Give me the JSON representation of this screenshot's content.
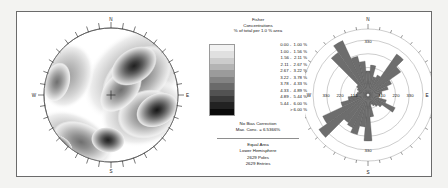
{
  "chart_data": [
    {
      "type": "heatmap",
      "subtype": "stereonet-contour",
      "title": "Fisher Concentrations equal-area lower-hemisphere pole density stereonet",
      "projection": "Equal Area",
      "hemisphere": "Lower Hemisphere",
      "poles": 2629,
      "entries": 2629,
      "max_concentration": 6.5366,
      "bias_correction": "No Bias Correction",
      "cardinal_labels": [
        "N",
        "E",
        "S",
        "W"
      ],
      "perimeter_tick_count": 36,
      "center_marker": "cross",
      "density_maxima": [
        {
          "label": "NNE girdle maximum",
          "azimuth_deg": 35,
          "radius_frac": 0.46,
          "level": 10
        },
        {
          "label": "E maximum",
          "azimuth_deg": 104,
          "radius_frac": 0.66,
          "level": 10
        },
        {
          "label": "SSW maximum",
          "azimuth_deg": 228,
          "radius_frac": 0.8,
          "level": 11
        },
        {
          "label": "S secondary maximum",
          "azimuth_deg": 192,
          "radius_frac": 0.56,
          "level": 8
        },
        {
          "label": "NW rim lobe",
          "azimuth_deg": 325,
          "radius_frac": 0.72,
          "level": 4
        }
      ]
    },
    {
      "type": "bar",
      "subtype": "rose-diagram",
      "title": "Rose diagram of pole trends",
      "bin_width_deg": 10,
      "radial_max": 330,
      "radial_ticks": [
        110,
        220,
        330
      ],
      "cardinal_labels": [
        "N",
        "E",
        "S",
        "W"
      ],
      "categories": [
        0,
        10,
        20,
        30,
        40,
        50,
        60,
        70,
        80,
        90,
        100,
        110,
        120,
        130,
        140,
        150,
        160,
        170,
        180,
        190,
        200,
        210,
        220,
        230,
        240,
        250,
        260,
        270,
        280,
        290,
        300,
        310,
        320,
        330,
        340,
        350
      ],
      "values": [
        120,
        150,
        95,
        110,
        250,
        200,
        130,
        105,
        70,
        60,
        55,
        95,
        150,
        85,
        70,
        60,
        50,
        110,
        230,
        160,
        205,
        180,
        170,
        300,
        250,
        140,
        100,
        60,
        55,
        50,
        60,
        70,
        260,
        300,
        200,
        170
      ],
      "xlabel": "Azimuth (degrees)",
      "ylabel": "Count per 10° bin"
    }
  ],
  "legend": {
    "title_line1": "Fisher",
    "title_line2": "Concentrations",
    "title_line3": "% of total per 1.0 % area",
    "classes": [
      "0.00 -  1.00 %",
      "1.00 -  1.56 %",
      "1.56 -  2.11 %",
      "2.11 -  2.67 %",
      "2.67 -  3.22 %",
      "3.22 -  3.78 %",
      "3.78 -  4.33 %",
      "4.33 -  4.89 %",
      "4.89 -  5.44 %",
      "5.44 -  6.00 %",
      "      > 6.00 %"
    ],
    "bias_line1": "No Bias Correction",
    "bias_line2": "Max. Conc. = 6.5366%",
    "foot_line1": "Equal Area",
    "foot_line2": "Lower Hemisphere",
    "foot_line3": "2629 Poles",
    "foot_line4": "2629 Entries"
  },
  "stereonet": {
    "label_n": "N",
    "label_e": "E",
    "label_s": "S",
    "label_w": "W"
  },
  "rose": {
    "label_n": "N",
    "label_e": "E",
    "label_s": "S",
    "label_w": "W",
    "tick_left_outer": "330",
    "tick_left_mid": "220",
    "tick_left_inner": "110",
    "tick_right_inner": "110",
    "tick_right_mid": "220",
    "tick_right_outer": "330",
    "tick_top": "330",
    "tick_bottom": "330"
  },
  "colors": {
    "frame_border": "#6b6b6b",
    "page_background": "#f3f3f1",
    "panel_background": "#ffffff",
    "rose_fill": "#6d6d6d",
    "rose_grid": "#8d8d8d",
    "text": "#161616"
  }
}
